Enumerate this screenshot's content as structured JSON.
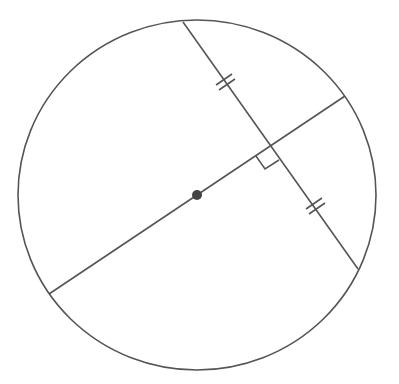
{
  "diagram": {
    "type": "circle-geometry",
    "stroke_color": "#555555",
    "circle": {
      "cx": 197,
      "cy": 195,
      "rx": 179,
      "ry": 175
    },
    "center_point": {
      "x": 197,
      "y": 195,
      "r": 5
    },
    "diameter": {
      "x1": 49,
      "y1": 294,
      "x2": 345,
      "y2": 96
    },
    "chord": {
      "x1": 183,
      "y1": 22,
      "x2": 358,
      "y2": 269
    },
    "intersection": {
      "x": 271,
      "y": 146
    },
    "right_angle_marker": true,
    "equal_segment_marks": [
      {
        "x": 227,
        "y": 82,
        "ticks": 2
      },
      {
        "x": 316,
        "y": 209,
        "ticks": 2
      }
    ]
  }
}
